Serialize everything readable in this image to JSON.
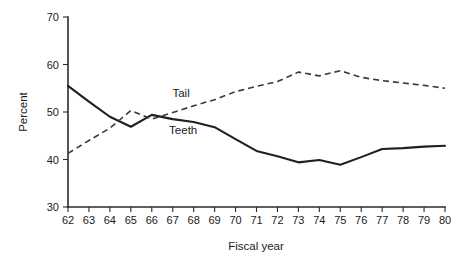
{
  "chart_data": {
    "type": "line",
    "title": "",
    "subtitle": "",
    "xlabel": "Fiscal year",
    "ylabel": "Percent",
    "xlim": [
      62,
      80
    ],
    "ylim": [
      30,
      70
    ],
    "yticks": [
      30,
      40,
      50,
      60,
      70
    ],
    "ytick_labels": [
      "30",
      "40",
      "50",
      "60",
      "70"
    ],
    "categories": [
      62,
      63,
      64,
      65,
      66,
      67,
      68,
      69,
      70,
      71,
      72,
      73,
      74,
      75,
      76,
      77,
      78,
      79,
      80
    ],
    "xtick_labels": [
      "62",
      "63",
      "64",
      "65",
      "66",
      "67",
      "68",
      "69",
      "70",
      "71",
      "72",
      "73",
      "74",
      "75",
      "76",
      "77",
      "78",
      "79",
      "80"
    ],
    "grid": false,
    "legend_position": "inline-annotation",
    "series": [
      {
        "name": "Teeth",
        "style": "solid",
        "color": "#1f1f1f",
        "values": [
          55.5,
          52.2,
          49.0,
          46.9,
          49.4,
          48.5,
          47.9,
          46.8,
          44.3,
          41.8,
          40.7,
          39.4,
          39.9,
          38.9,
          40.5,
          42.2,
          42.4,
          42.7,
          42.9
        ]
      },
      {
        "name": "Tail",
        "style": "dashed",
        "color": "#3a3a3a",
        "values": [
          41.3,
          44.0,
          46.6,
          50.3,
          48.5,
          49.9,
          51.3,
          52.6,
          54.3,
          55.4,
          56.4,
          58.4,
          57.6,
          58.7,
          57.3,
          56.6,
          56.1,
          55.6,
          55.0
        ]
      }
    ],
    "annotations": [
      {
        "name": "Tail",
        "text": "Tail",
        "x": 67.4,
        "y": 53.2
      },
      {
        "name": "Teeth",
        "text": "Teeth",
        "x": 67.5,
        "y": 45.4
      }
    ]
  }
}
